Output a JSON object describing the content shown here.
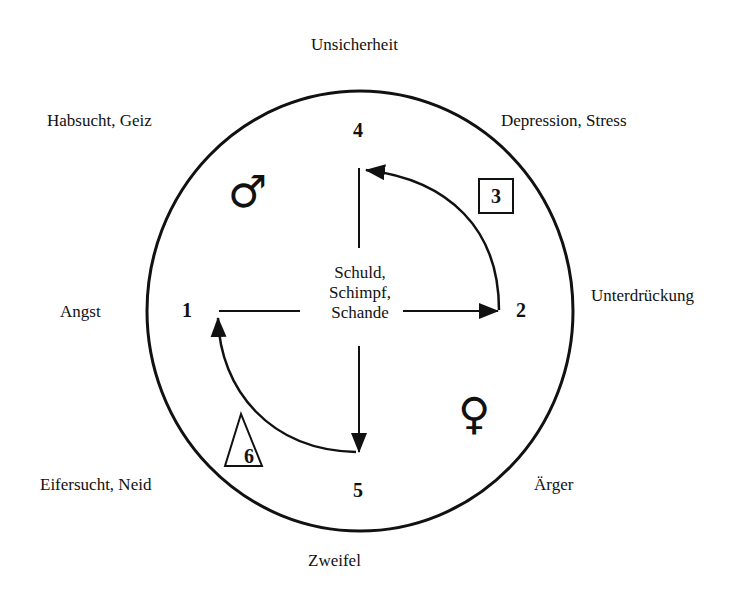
{
  "diagram": {
    "center_text": [
      "Schuld,",
      "Schimpf,",
      "Schande"
    ],
    "nodes": {
      "n1": "1",
      "n2": "2",
      "n4": "4",
      "n5": "5"
    },
    "box_label": "3",
    "triangle_label": "6",
    "male_symbol": "♂",
    "female_symbol": "♀",
    "outer_labels": {
      "top": "Unsicherheit",
      "top_left": "Habsucht, Geiz",
      "top_right": "Depression, Stress",
      "left": "Angst",
      "right": "Unterdrückung",
      "bottom_left": "Eifersucht, Neid",
      "bottom_right": "Ärger",
      "bottom": "Zweifel"
    }
  }
}
